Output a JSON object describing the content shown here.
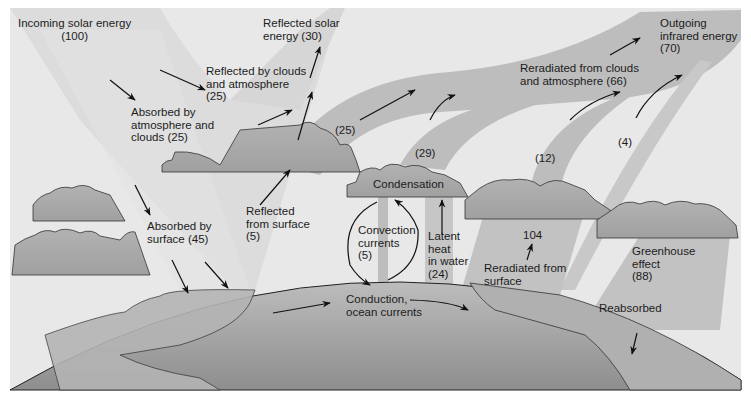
{
  "diagram": {
    "colors": {
      "sky": "#e7e7e7",
      "solar_beam": "#dcdcdc",
      "infrared_band": "#bdbdbd",
      "cloud": "#a8a8a8",
      "earth_land": "#a9a9a9",
      "earth_ocean": "#9a9a9a",
      "arrow": "#111111",
      "text": "#1c1c1c"
    },
    "labels": {
      "incoming": {
        "line1": "Incoming solar energy",
        "line2": "(100)"
      },
      "reflected_solar": {
        "line1": "Reflected solar",
        "line2": "energy (30)"
      },
      "outgoing_ir": {
        "line1": "Outgoing",
        "line2": "infrared energy",
        "line3": "(70)"
      },
      "reflected_clouds": {
        "line1": "Reflected by clouds",
        "line2": "and atmosphere",
        "line3": "(25)"
      },
      "absorbed_atm": {
        "line1": "Absorbed by",
        "line2": "atmosphere and",
        "line3": "clouds (25)"
      },
      "reradiated_clouds": {
        "line1": "Reradiated from clouds",
        "line2": "and atmosphere (66)"
      },
      "band_25": "(25)",
      "band_29": "(29)",
      "band_12": "(12)",
      "band_4": "(4)",
      "condensation": "Condensation",
      "absorbed_surface": {
        "line1": "Absorbed by",
        "line2": "surface (45)"
      },
      "reflected_surface": {
        "line1": "Reflected",
        "line2": "from surface",
        "line3": "(5)"
      },
      "convection": {
        "line1": "Convection",
        "line2": "currents",
        "line3": "(5)"
      },
      "latent_heat": {
        "line1": "Latent",
        "line2": "heat",
        "line3": "in water",
        "line4": "(24)"
      },
      "value_104": "104",
      "reradiated_surface": {
        "line1": "Reradiated from",
        "line2": "surface"
      },
      "greenhouse": {
        "line1": "Greenhouse",
        "line2": "effect",
        "line3": "(88)"
      },
      "reabsorbed": "Reabsorbed",
      "conduction": {
        "line1": "Conduction,",
        "line2": "ocean currents"
      }
    },
    "flows": [
      {
        "name": "Incoming solar energy",
        "value": 100
      },
      {
        "name": "Reflected solar energy",
        "value": 30
      },
      {
        "name": "Reflected by clouds and atmosphere",
        "value": 25
      },
      {
        "name": "Reflected from surface",
        "value": 5
      },
      {
        "name": "Absorbed by atmosphere and clouds",
        "value": 25
      },
      {
        "name": "Absorbed by surface",
        "value": 45
      },
      {
        "name": "Outgoing infrared energy",
        "value": 70
      },
      {
        "name": "Reradiated from clouds and atmosphere",
        "value": 66
      },
      {
        "name": "Infrared band",
        "value": 25
      },
      {
        "name": "Infrared band",
        "value": 29
      },
      {
        "name": "Infrared band",
        "value": 12
      },
      {
        "name": "Infrared band from surface",
        "value": 4
      },
      {
        "name": "Convection currents",
        "value": 5
      },
      {
        "name": "Latent heat in water",
        "value": 24
      },
      {
        "name": "Reradiated from surface",
        "value": 104
      },
      {
        "name": "Greenhouse effect",
        "value": 88
      }
    ]
  }
}
